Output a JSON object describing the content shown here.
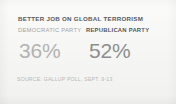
{
  "card": {
    "background_color": "#f6f6f4",
    "headline": "BETTER JOB ON GLOBAL TERRORISM",
    "source": "SOURCE: GALLUP POLL, SEPT. 9-13"
  },
  "chart_data": {
    "type": "bar",
    "title": "BETTER JOB ON GLOBAL TERRORISM",
    "categories": [
      "DEMOCRATIC PARTY",
      "REPUBLICAN PARTY"
    ],
    "values": [
      36,
      52
    ],
    "value_labels": [
      "36%",
      "52%"
    ],
    "unit": "%",
    "xlabel": "",
    "ylabel": "",
    "ylim": [
      0,
      100
    ],
    "grid": false,
    "legend": "none",
    "annotations": [
      "SOURCE: GALLUP POLL, SEPT. 9-13"
    ],
    "series_colors": [
      "#b3b3b2",
      "#8e8e8f"
    ],
    "highlighted_category": "REPUBLICAN PARTY"
  }
}
